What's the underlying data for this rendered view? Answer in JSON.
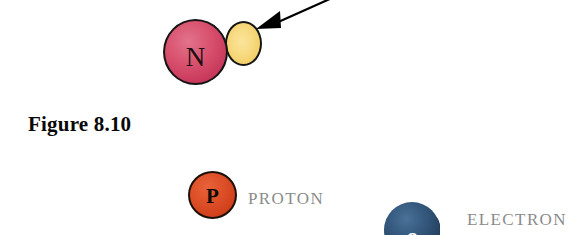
{
  "figure": {
    "caption": "Figure 8.10",
    "background_color": "#ffffff"
  },
  "diagram": {
    "atom": {
      "nucleus_label": "N",
      "nucleus_color": "#d9536f",
      "nucleus_outline_color": "#151515",
      "attached_particle_label": "",
      "attached_particle_color": "#f8dc86",
      "attached_particle_outline_color": "#151515"
    },
    "annotation": {
      "arrow_name": "pointer-arrow",
      "arrow_color": "#000000",
      "arrow_direction": "down-left"
    }
  },
  "legend": {
    "items": [
      {
        "glyph": "P",
        "label": "PROTON",
        "color": "#df5229",
        "glyph_color": "#120a06",
        "label_color": "#8b8b8b"
      },
      {
        "glyph": "e",
        "label": "ELECTRON",
        "color": "#35597e",
        "glyph_color": "#f4f6f8",
        "label_color": "#8b8b8b"
      }
    ]
  }
}
